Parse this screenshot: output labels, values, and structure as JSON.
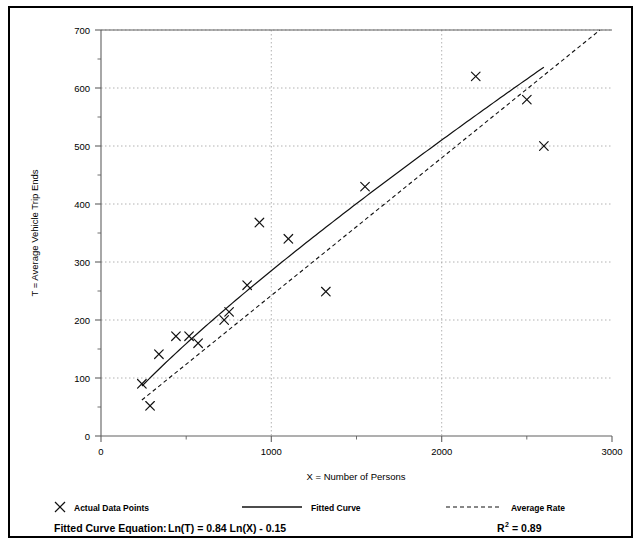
{
  "chart_data": {
    "type": "scatter",
    "title": "",
    "xlabel": "X = Number of Persons",
    "ylabel": "T = Average Vehicle Trip Ends",
    "xlim": [
      0,
      3000
    ],
    "ylim": [
      0,
      700
    ],
    "xticks": [
      0,
      1000,
      2000,
      3000
    ],
    "xtick_labels": [
      "0",
      "1000",
      "2000",
      "3000"
    ],
    "xminor_ticks": [
      500,
      1500,
      2500
    ],
    "yticks": [
      0,
      100,
      200,
      300,
      400,
      500,
      600,
      700
    ],
    "ytick_labels": [
      "0",
      "100",
      "200",
      "300",
      "400",
      "500",
      "600",
      "700"
    ],
    "yminor_ticks": [
      50,
      150,
      250,
      350,
      450,
      550,
      650
    ],
    "grid": "dotted-gray-major",
    "series": [
      {
        "name": "Actual Data Points",
        "type": "scatter",
        "marker": "x",
        "points": [
          [
            240,
            90
          ],
          [
            288,
            52
          ],
          [
            340,
            141
          ],
          [
            440,
            172
          ],
          [
            517,
            172
          ],
          [
            570,
            160
          ],
          [
            723,
            200
          ],
          [
            752,
            214
          ],
          [
            858,
            260
          ],
          [
            930,
            368
          ],
          [
            1100,
            340
          ],
          [
            1320,
            249
          ],
          [
            1550,
            430
          ],
          [
            2200,
            620
          ],
          [
            2500,
            580
          ],
          [
            2600,
            500
          ]
        ]
      },
      {
        "name": "Fitted Curve",
        "type": "line",
        "style": "solid",
        "equation": "Ln(T) = 0.84 Ln(X) - 0.15",
        "a": 0.84,
        "b": -0.15,
        "x_start": 240,
        "x_end": 2600
      },
      {
        "name": "Average Rate",
        "type": "line",
        "style": "dashed",
        "x_start": 240,
        "x_end": 2980,
        "y_start": 62,
        "y_end": 712
      }
    ]
  },
  "legend": {
    "position": "below-axis",
    "items": [
      {
        "label": "Actual Data Points",
        "marker": "x-marker"
      },
      {
        "label": "Fitted Curve",
        "marker": "solid-line"
      },
      {
        "label": "Average Rate",
        "marker": "dashed-line"
      }
    ]
  },
  "footer": {
    "equation_label": "Fitted Curve Equation:",
    "equation_body": "Ln(T) = 0.84 Ln(X) - 0.15",
    "r2_base": "R",
    "r2_exponent": "2",
    "r2_value": "= 0.89"
  },
  "colors": {
    "ink": "#000000",
    "grid": "#9a9a9a",
    "axis": "#555555",
    "background": "#ffffff",
    "border": "#000000"
  }
}
